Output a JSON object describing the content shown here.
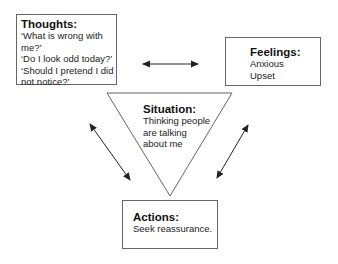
{
  "diagram": {
    "thoughts": {
      "title": "Thoughts:",
      "lines": [
        "‘What is wrong with",
        "me?’",
        "‘Do I look odd today?’",
        "‘Should I pretend I did",
        "not notice?’"
      ]
    },
    "feelings": {
      "title": "Feelings:",
      "lines": [
        "Anxious",
        "Upset"
      ]
    },
    "situation": {
      "title": "Situation:",
      "lines": [
        "Thinking people",
        "are talking",
        "about me"
      ]
    },
    "actions": {
      "title": "Actions:",
      "lines": [
        "Seek reassurance."
      ]
    },
    "connectors": [
      {
        "from": "thoughts",
        "to": "feelings",
        "type": "double-arrow"
      },
      {
        "from": "thoughts",
        "to": "actions",
        "type": "double-arrow"
      },
      {
        "from": "feelings",
        "to": "actions",
        "type": "double-arrow"
      }
    ],
    "colors": {
      "border": "#666666",
      "text": "#222222",
      "arrow": "#222222"
    }
  }
}
